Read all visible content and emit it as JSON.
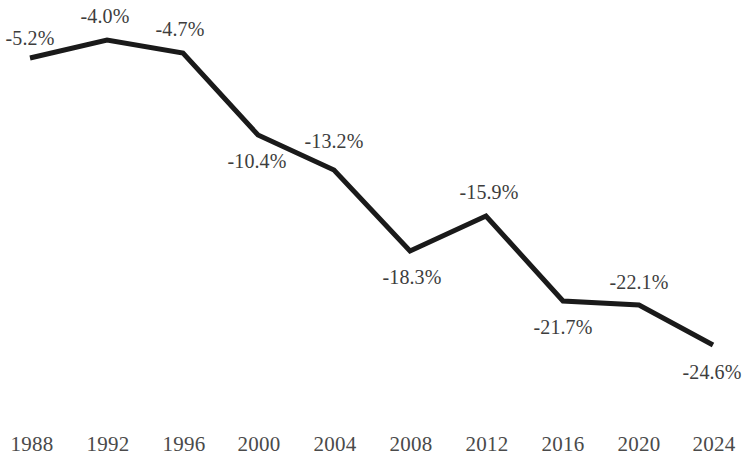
{
  "chart_data": {
    "type": "line",
    "title": "",
    "subtitle": "",
    "xlabel": "",
    "ylabel": "",
    "grid": false,
    "legend": "none",
    "categories": [
      "1988",
      "1992",
      "1996",
      "2000",
      "2004",
      "2008",
      "2012",
      "2016",
      "2020",
      "2024"
    ],
    "values": [
      -5.2,
      -4.0,
      -4.7,
      -10.4,
      -13.2,
      -18.3,
      -15.9,
      -21.7,
      -22.1,
      -24.6
    ],
    "point_labels": [
      "-5.2%",
      "-4.0%",
      "-4.7%",
      "-10.4%",
      "-13.2%",
      "-18.3%",
      "-15.9%",
      "-21.7%",
      "-22.1%",
      "-24.6%"
    ],
    "series": [
      {
        "name": "",
        "values": [
          -5.2,
          -4.0,
          -4.7,
          -10.4,
          -13.2,
          -18.3,
          -15.9,
          -21.7,
          -22.1,
          -24.6
        ]
      }
    ],
    "xlim": [
      1988,
      2024
    ],
    "ylim": [
      -24.6,
      -4.0
    ],
    "line_color": "#1a1a1a",
    "label_color": "#3d3d3d",
    "axis_label_color": "#4a4a4a",
    "background_color": "#ffffff",
    "line_width": 5,
    "points": [
      {
        "category": "1988",
        "value": -5.2,
        "label": "-5.2%",
        "px": 30,
        "py": 58,
        "lx": 30,
        "ly": 38
      },
      {
        "category": "1992",
        "value": -4.0,
        "label": "-4.0%",
        "px": 107,
        "py": 40,
        "lx": 105,
        "ly": 16
      },
      {
        "category": "1996",
        "value": -4.7,
        "label": "-4.7%",
        "px": 183,
        "py": 53,
        "lx": 180,
        "ly": 29
      },
      {
        "category": "2000",
        "value": -10.4,
        "label": "-10.4%",
        "px": 258,
        "py": 135,
        "lx": 257,
        "ly": 161
      },
      {
        "category": "2004",
        "value": -13.2,
        "label": "-13.2%",
        "px": 334,
        "py": 170,
        "lx": 334,
        "ly": 141
      },
      {
        "category": "2008",
        "value": -18.3,
        "label": "-18.3%",
        "px": 410,
        "py": 251,
        "lx": 412,
        "ly": 277
      },
      {
        "category": "2012",
        "value": -15.9,
        "label": "-15.9%",
        "px": 486,
        "py": 216,
        "lx": 489,
        "ly": 192
      },
      {
        "category": "2016",
        "value": -21.7,
        "label": "-21.7%",
        "px": 563,
        "py": 301,
        "lx": 563,
        "ly": 327
      },
      {
        "category": "2020",
        "value": -22.1,
        "label": "-22.1%",
        "px": 639,
        "py": 305,
        "lx": 639,
        "ly": 282
      },
      {
        "category": "2024",
        "value": -24.6,
        "label": "-24.6%",
        "px": 713,
        "py": 345,
        "lx": 712,
        "ly": 372
      }
    ],
    "x_axis_ticks": [
      {
        "label": "1988",
        "x": 32,
        "y": 444
      },
      {
        "label": "1992",
        "x": 108,
        "y": 444
      },
      {
        "label": "1996",
        "x": 184,
        "y": 444
      },
      {
        "label": "2000",
        "x": 259,
        "y": 444
      },
      {
        "label": "2004",
        "x": 335,
        "y": 444
      },
      {
        "label": "2008",
        "x": 411,
        "y": 444
      },
      {
        "label": "2012",
        "x": 487,
        "y": 444
      },
      {
        "label": "2016",
        "x": 563,
        "y": 444
      },
      {
        "label": "2020",
        "x": 639,
        "y": 444
      },
      {
        "label": "2024",
        "x": 714,
        "y": 444
      }
    ]
  }
}
